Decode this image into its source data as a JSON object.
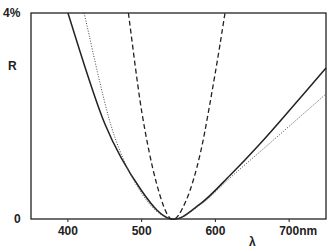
{
  "chart_data": {
    "type": "line",
    "title": "",
    "xlabel": "λ",
    "ylabel": "R",
    "xlim": [
      350,
      750
    ],
    "ylim": [
      0,
      4
    ],
    "x_unit": "nm",
    "y_unit": "%",
    "x_ticks": [
      "400",
      "500",
      "600",
      "700nm"
    ],
    "y_ticks": [
      "0",
      "4%"
    ],
    "grid": false,
    "legend": null,
    "series": [
      {
        "name": "solid",
        "style": "solid",
        "x": [
          400,
          450,
          500,
          540,
          580,
          620,
          660,
          700,
          750
        ],
        "y": [
          4.0,
          1.85,
          0.55,
          0.0,
          0.3,
          0.85,
          1.45,
          2.1,
          2.93
        ]
      },
      {
        "name": "dotted",
        "style": "dotted",
        "x": [
          422,
          460,
          500,
          540,
          580,
          620,
          660,
          700,
          750
        ],
        "y": [
          4.0,
          1.75,
          0.5,
          0.0,
          0.28,
          0.8,
          1.3,
          1.8,
          2.43
        ]
      },
      {
        "name": "dashed",
        "style": "dashed",
        "x": [
          482,
          500,
          520,
          540,
          560,
          580,
          600,
          613
        ],
        "y": [
          4.0,
          2.1,
          0.7,
          0.0,
          0.35,
          1.3,
          2.85,
          4.0
        ]
      }
    ]
  },
  "labels": {
    "y_top": "4%",
    "y_bottom": "0",
    "y_axis": "R",
    "x_axis": "λ",
    "x_ticks": [
      "400",
      "500",
      "600",
      "700nm"
    ]
  }
}
